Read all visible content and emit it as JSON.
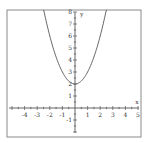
{
  "chart_data": {
    "type": "line",
    "title": "",
    "function": "y = x^2 + 2",
    "xlabel": "x",
    "ylabel": "y",
    "xlim": [
      -5.3,
      5.3
    ],
    "ylim": [
      -2.2,
      8.2
    ],
    "grid": false,
    "legend": null,
    "x_ticks": [
      -4,
      -3,
      -2,
      -1,
      1,
      2,
      3,
      4,
      5
    ],
    "y_ticks": [
      -1,
      1,
      2,
      3,
      4,
      5,
      6,
      7,
      8
    ],
    "series": [
      {
        "name": "parabola",
        "x": [
          -2.45,
          -2,
          -1.5,
          -1,
          -0.5,
          0,
          0.5,
          1,
          1.5,
          2,
          2.45
        ],
        "y": [
          8.0,
          6.0,
          4.25,
          3.0,
          2.25,
          2.0,
          2.25,
          3.0,
          4.25,
          6.0,
          8.0
        ]
      }
    ],
    "colors": {
      "frame": "#888888",
      "axis": "#555555",
      "curve": "#555555"
    }
  },
  "labels": {
    "x_axis": "x",
    "y_axis": "y",
    "x_ticks": [
      "-4",
      "-3",
      "-2",
      "-1",
      "1",
      "2",
      "3",
      "4",
      "5"
    ],
    "y_ticks": [
      "-1",
      "1",
      "2",
      "3",
      "4",
      "5",
      "6",
      "7",
      "8"
    ]
  }
}
